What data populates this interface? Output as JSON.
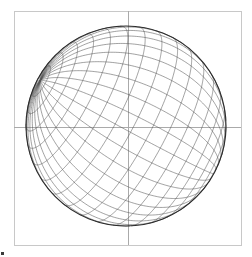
{
  "figure": {
    "background_color": "#ffffff",
    "width": 252,
    "height": 257
  },
  "frame": {
    "name": "plot-frame",
    "x": 14,
    "y": 11,
    "width": 227,
    "height": 234,
    "stroke_color": "#c8c8c8",
    "stroke_width": 1,
    "fill": "none"
  },
  "axes": {
    "vertical_line": {
      "x": 128,
      "y1": 11,
      "y2": 245,
      "stroke_color": "#aaaaaa",
      "stroke_width": 1
    },
    "horizontal_line": {
      "y": 127,
      "x1": 14,
      "x2": 241,
      "stroke_color": "#aaaaaa",
      "stroke_width": 1
    }
  },
  "globe": {
    "name": "sphere-outline",
    "center_x": 126,
    "center_y": 126,
    "radius": 100,
    "limb_stroke_color": "#2b2b2b",
    "limb_stroke_width": 1.1,
    "fill": "none"
  },
  "graticule": {
    "meridian_count": 18,
    "parallel_count": 17,
    "meridian_step_deg": 10,
    "parallel_step_deg": 10,
    "stroke_color": "#555555",
    "stroke_width": 0.55,
    "projection": "orthographic",
    "rotation": {
      "lambda_deg": 28,
      "phi_deg": 14,
      "gamma_deg": 62
    }
  },
  "corner_mark": {
    "name": "corner-mark",
    "x": 1,
    "y": 252,
    "width": 3,
    "height": 3,
    "color": "#3a3a3a"
  },
  "chart_data": {
    "type": "scatter",
    "xlabel": "",
    "ylabel": "",
    "xlim": [
      -1,
      1
    ],
    "ylim": [
      -1,
      1
    ],
    "grid": true,
    "legend": "none",
    "series": [
      {
        "name": "meridians",
        "description": "Lines of constant longitude, every 10 degrees from -180 to 170",
        "values": [
          -180,
          -170,
          -160,
          -150,
          -140,
          -130,
          -120,
          -110,
          -100,
          -90,
          -80,
          -70,
          -60,
          -50,
          -40,
          -30,
          -20,
          -10,
          0,
          10,
          20,
          30,
          40,
          50,
          60,
          70,
          80,
          90,
          100,
          110,
          120,
          130,
          140,
          150,
          160,
          170
        ]
      },
      {
        "name": "parallels",
        "description": "Lines of constant latitude, every 10 degrees from -80 to 80",
        "values": [
          -80,
          -70,
          -60,
          -50,
          -40,
          -30,
          -20,
          -10,
          0,
          10,
          20,
          30,
          40,
          50,
          60,
          70,
          80
        ]
      }
    ],
    "annotations": [
      "Sphere limb drawn as a full circle",
      "Crosshair axis lines through plot centre"
    ]
  }
}
